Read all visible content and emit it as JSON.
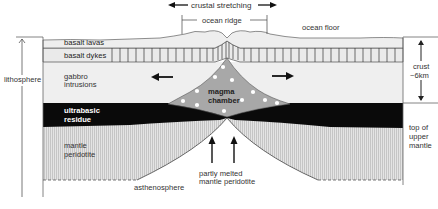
{
  "diagram": {
    "type": "cross-section"
  },
  "labels": {
    "crustal_stretching": "crustal stretching",
    "ocean_ridge": "ocean ridge",
    "ocean_floor": "ocean floor",
    "basalt_lavas": "basalt lavas",
    "basalt_dykes": "basalt dykes",
    "gabbro_line1": "gabbro",
    "gabbro_line2": "intrusions",
    "magma_line1": "magma",
    "magma_line2": "chamber",
    "ultrabasic_line1": "ultrabasic",
    "ultrabasic_line2": "residue",
    "mantle_line1": "mantle",
    "mantle_line2": "peridotite",
    "lithosphere": "lithosphere",
    "asthenosphere": "asthenosphere",
    "partly_line1": "partly melted",
    "partly_line2": "mantle peridotite",
    "crust_line1": "crust",
    "crust_line2": "~6km",
    "topmantle_line1": "top of",
    "topmantle_line2": "upper",
    "topmantle_line3": "mantle"
  },
  "colors": {
    "background": "#ffffff",
    "lavas": "#ececec",
    "dykes": "#e8e8e8",
    "gabbro": "#eeeeee",
    "magma": "#a5a5a5",
    "residue": "#0a0a0a",
    "peridotite": "#d4d4d4",
    "lines": "#555555"
  }
}
